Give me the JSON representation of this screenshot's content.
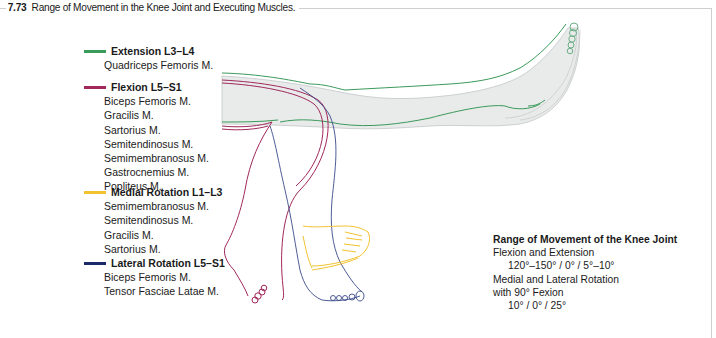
{
  "figure": {
    "number": "7.73",
    "title": "Range of Movement in the Knee Joint and Executing Muscles."
  },
  "legend": [
    {
      "id": "extension",
      "label": "Extension L3–L4",
      "color": "#3a9a5a",
      "muscles": [
        "Quadriceps Femoris M."
      ]
    },
    {
      "id": "flexion",
      "label": "Flexion L5–S1",
      "color": "#a0285a",
      "muscles": [
        "Biceps Femoris M.",
        "Gracilis M.",
        "Sartorius M.",
        "Semitendinosus M.",
        "Semimembranosus M.",
        "Gastrocnemius M.",
        "Popliteus M."
      ]
    },
    {
      "id": "medial-rotation",
      "label": "Medial Rotation L1–L3",
      "color": "#f2c230",
      "muscles": [
        "Semimembranosus M.",
        "Semitendinosus M.",
        "Gracilis M.",
        "Sartorius M."
      ]
    },
    {
      "id": "lateral-rotation",
      "label": "Lateral Rotation L5–S1",
      "color": "#1c2a6a",
      "muscles": [
        "Biceps Femoris M.",
        "Tensor Fasciae Latae M."
      ]
    }
  ],
  "range_of_movement": {
    "title": "Range of Movement of the Knee Joint",
    "flex_ext_label": "Flexion and Extension",
    "flex_ext_values": "120°–150° / 0° / 5°–10°",
    "rotation_label": "Medial and Lateral Rotation",
    "rotation_condition": "with 90°  Fexion",
    "rotation_values": "10° / 0° / 25°"
  },
  "colors": {
    "limb_fill": "#e9ebeb",
    "limb_outline": "#b8bcbc",
    "frame": "#cfcfcf"
  }
}
